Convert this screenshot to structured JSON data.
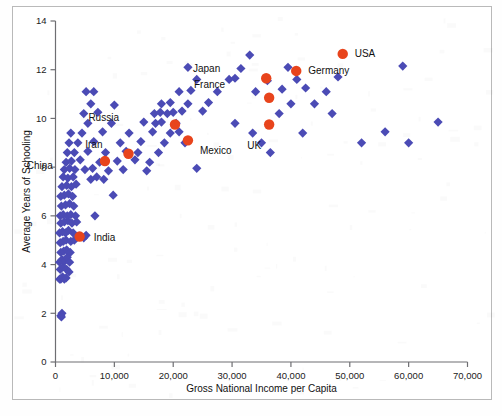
{
  "chart_data": {
    "type": "scatter",
    "title": "",
    "xlabel": "Gross National Income per Capita",
    "ylabel": "Average Years of Schooling",
    "xlim": [
      0,
      70000
    ],
    "ylim": [
      0,
      14
    ],
    "xticks": [
      0,
      10000,
      20000,
      30000,
      40000,
      50000,
      60000,
      70000
    ],
    "xticklabels": [
      "0",
      "10,000",
      "20,000",
      "30,000",
      "40,000",
      "50,000",
      "60,000",
      "70,000"
    ],
    "yticks": [
      0,
      2,
      4,
      6,
      8,
      10,
      12,
      14
    ],
    "yticklabels": [
      "0",
      "2",
      "4",
      "6",
      "8",
      "10",
      "12",
      "14"
    ],
    "grid": false,
    "legend": "none",
    "colors": {
      "marker": "#4b4bb5",
      "highlight": "#e8441c",
      "axis": "#6e6e72",
      "text": "#111111",
      "background": "#ffffff"
    },
    "series": [
      {
        "name": "Countries",
        "marker": "diamond",
        "color": "#4b4bb5",
        "points": [
          [
            900,
            1.9
          ],
          [
            1100,
            2.0
          ],
          [
            1000,
            1.85
          ],
          [
            700,
            3.4
          ],
          [
            900,
            3.4
          ],
          [
            1200,
            3.5
          ],
          [
            1500,
            3.4
          ],
          [
            1800,
            3.45
          ],
          [
            800,
            3.8
          ],
          [
            1300,
            3.9
          ],
          [
            1900,
            3.8
          ],
          [
            2300,
            3.7
          ],
          [
            700,
            4.1
          ],
          [
            1100,
            4.2
          ],
          [
            1600,
            4.15
          ],
          [
            2000,
            4.3
          ],
          [
            2400,
            4.1
          ],
          [
            900,
            4.5
          ],
          [
            1400,
            4.55
          ],
          [
            1900,
            4.6
          ],
          [
            2500,
            4.5
          ],
          [
            800,
            4.9
          ],
          [
            1300,
            4.95
          ],
          [
            1800,
            5.0
          ],
          [
            2600,
            4.95
          ],
          [
            3200,
            5.0
          ],
          [
            700,
            5.3
          ],
          [
            1200,
            5.35
          ],
          [
            1700,
            5.3
          ],
          [
            2200,
            5.4
          ],
          [
            3000,
            5.3
          ],
          [
            4800,
            5.1
          ],
          [
            5200,
            5.2
          ],
          [
            900,
            5.7
          ],
          [
            1500,
            5.75
          ],
          [
            2100,
            5.8
          ],
          [
            2800,
            5.7
          ],
          [
            3600,
            5.75
          ],
          [
            800,
            6.0
          ],
          [
            1300,
            6.05
          ],
          [
            2000,
            6.0
          ],
          [
            2600,
            6.05
          ],
          [
            3400,
            6.0
          ],
          [
            6700,
            6.0
          ],
          [
            1000,
            6.4
          ],
          [
            1700,
            6.45
          ],
          [
            2400,
            6.5
          ],
          [
            3100,
            6.4
          ],
          [
            900,
            6.8
          ],
          [
            1500,
            6.85
          ],
          [
            2200,
            6.9
          ],
          [
            2900,
            6.8
          ],
          [
            9800,
            6.85
          ],
          [
            1100,
            7.2
          ],
          [
            1900,
            7.25
          ],
          [
            2700,
            7.2
          ],
          [
            3500,
            7.3
          ],
          [
            1300,
            7.6
          ],
          [
            2100,
            7.55
          ],
          [
            3000,
            7.6
          ],
          [
            6000,
            7.5
          ],
          [
            7000,
            7.6
          ],
          [
            8200,
            7.5
          ],
          [
            1500,
            7.9
          ],
          [
            2400,
            7.95
          ],
          [
            3300,
            7.9
          ],
          [
            5000,
            7.9
          ],
          [
            6300,
            7.95
          ],
          [
            9000,
            7.85
          ],
          [
            11500,
            7.9
          ],
          [
            15500,
            7.85
          ],
          [
            24000,
            7.95
          ],
          [
            1800,
            8.2
          ],
          [
            2700,
            8.25
          ],
          [
            4200,
            8.3
          ],
          [
            7500,
            8.2
          ],
          [
            10500,
            8.25
          ],
          [
            13500,
            8.3
          ],
          [
            16000,
            8.2
          ],
          [
            2000,
            8.6
          ],
          [
            3200,
            8.6
          ],
          [
            5500,
            8.65
          ],
          [
            8500,
            8.6
          ],
          [
            12000,
            8.65
          ],
          [
            14000,
            8.6
          ],
          [
            17500,
            8.6
          ],
          [
            36500,
            8.6
          ],
          [
            2300,
            9.0
          ],
          [
            3800,
            9.0
          ],
          [
            6500,
            9.05
          ],
          [
            11000,
            9.0
          ],
          [
            14500,
            9.05
          ],
          [
            18500,
            9.0
          ],
          [
            22000,
            9.0
          ],
          [
            35000,
            9.0
          ],
          [
            52000,
            9.0
          ],
          [
            60000,
            9.0
          ],
          [
            2600,
            9.4
          ],
          [
            4500,
            9.4
          ],
          [
            8000,
            9.45
          ],
          [
            12500,
            9.4
          ],
          [
            16500,
            9.45
          ],
          [
            19500,
            9.4
          ],
          [
            21000,
            9.45
          ],
          [
            33500,
            9.4
          ],
          [
            42000,
            9.4
          ],
          [
            56000,
            9.45
          ],
          [
            5500,
            9.8
          ],
          [
            9500,
            9.8
          ],
          [
            15000,
            9.85
          ],
          [
            17000,
            9.8
          ],
          [
            18000,
            9.85
          ],
          [
            20500,
            9.8
          ],
          [
            30500,
            9.8
          ],
          [
            65000,
            9.85
          ],
          [
            4800,
            10.2
          ],
          [
            7200,
            10.25
          ],
          [
            16800,
            10.2
          ],
          [
            17800,
            10.25
          ],
          [
            19000,
            10.2
          ],
          [
            20000,
            10.25
          ],
          [
            21500,
            10.3
          ],
          [
            25000,
            10.3
          ],
          [
            38000,
            10.2
          ],
          [
            47000,
            10.2
          ],
          [
            6000,
            10.6
          ],
          [
            10000,
            10.55
          ],
          [
            18000,
            10.6
          ],
          [
            19500,
            10.65
          ],
          [
            22500,
            10.6
          ],
          [
            26000,
            10.65
          ],
          [
            40000,
            10.6
          ],
          [
            44000,
            10.6
          ],
          [
            5200,
            11.1
          ],
          [
            6500,
            11.1
          ],
          [
            21000,
            11.1
          ],
          [
            23000,
            11.15
          ],
          [
            27500,
            11.1
          ],
          [
            34000,
            11.1
          ],
          [
            38500,
            11.2
          ],
          [
            42500,
            11.25
          ],
          [
            46000,
            11.1
          ],
          [
            24000,
            11.6
          ],
          [
            29500,
            11.6
          ],
          [
            30500,
            11.65
          ],
          [
            36000,
            11.55
          ],
          [
            41000,
            11.6
          ],
          [
            48000,
            11.7
          ],
          [
            22500,
            12.1
          ],
          [
            31500,
            12.05
          ],
          [
            39500,
            12.1
          ],
          [
            59000,
            12.15
          ],
          [
            33000,
            12.6
          ]
        ]
      },
      {
        "name": "Highlighted countries",
        "marker": "circle",
        "color": "#e8441c",
        "points": [
          {
            "label": "China",
            "x": 8400,
            "y": 8.25,
            "label_dx": -52,
            "label_dy": 8
          },
          {
            "label": "Iran",
            "x": 12400,
            "y": 8.55,
            "label_dx": -26,
            "label_dy": -6
          },
          {
            "label": "Russia",
            "x": 20300,
            "y": 9.75,
            "label_dx": -56,
            "label_dy": -4
          },
          {
            "label": "Mexico",
            "x": 22500,
            "y": 9.1,
            "label_dx": 12,
            "label_dy": 14
          },
          {
            "label": "India",
            "x": 4100,
            "y": 5.15,
            "label_dx": 14,
            "label_dy": 4
          },
          {
            "label": "Japan",
            "x": 35800,
            "y": 11.65,
            "label_dx": -46,
            "label_dy": -6
          },
          {
            "label": "Germany",
            "x": 40900,
            "y": 11.95,
            "label_dx": 12,
            "label_dy": 3
          },
          {
            "label": "USA",
            "x": 48800,
            "y": 12.65,
            "label_dx": 12,
            "label_dy": 3
          },
          {
            "label": "France",
            "x": 36300,
            "y": 10.85,
            "label_dx": -44,
            "label_dy": -10
          },
          {
            "label": "UK",
            "x": 36300,
            "y": 9.75,
            "label_dx": -8,
            "label_dy": 24
          }
        ]
      }
    ]
  }
}
